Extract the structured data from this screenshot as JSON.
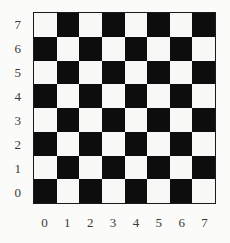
{
  "figure": {
    "background_color": "#fbfbf9"
  },
  "chart_data": {
    "type": "heatmap",
    "title": "",
    "subtitle": "",
    "xlabel": "",
    "ylabel": "",
    "grid": false,
    "legend": null,
    "rows": 8,
    "cols": 8,
    "x": [
      0,
      1,
      2,
      3,
      4,
      5,
      6,
      7
    ],
    "y": [
      7,
      6,
      5,
      4,
      3,
      2,
      1,
      0
    ],
    "xlim": [
      0,
      7
    ],
    "ylim": [
      0,
      7
    ],
    "x_tick_labels": [
      "0",
      "1",
      "2",
      "3",
      "4",
      "5",
      "6",
      "7"
    ],
    "y_tick_labels": [
      "7",
      "6",
      "5",
      "4",
      "3",
      "2",
      "1",
      "0"
    ],
    "colors": {
      "light_cell": "#f8f8f6",
      "dark_cell": "#0d0d0d",
      "border": "#1a1a1a",
      "tick_label": "#3a3a38"
    },
    "cell_states": [
      [
        "light",
        "dark",
        "light",
        "dark",
        "light",
        "dark",
        "light",
        "dark"
      ],
      [
        "dark",
        "light",
        "dark",
        "light",
        "dark",
        "light",
        "dark",
        "light"
      ],
      [
        "light",
        "dark",
        "light",
        "dark",
        "light",
        "dark",
        "light",
        "dark"
      ],
      [
        "dark",
        "light",
        "dark",
        "light",
        "dark",
        "light",
        "dark",
        "light"
      ],
      [
        "light",
        "dark",
        "light",
        "dark",
        "light",
        "dark",
        "light",
        "dark"
      ],
      [
        "dark",
        "light",
        "dark",
        "light",
        "dark",
        "light",
        "dark",
        "light"
      ],
      [
        "light",
        "dark",
        "light",
        "dark",
        "light",
        "dark",
        "light",
        "dark"
      ],
      [
        "dark",
        "light",
        "dark",
        "light",
        "dark",
        "light",
        "dark",
        "light"
      ]
    ],
    "values": [
      [
        1,
        0,
        1,
        0,
        1,
        0,
        1,
        0
      ],
      [
        0,
        1,
        0,
        1,
        0,
        1,
        0,
        1
      ],
      [
        1,
        0,
        1,
        0,
        1,
        0,
        1,
        0
      ],
      [
        0,
        1,
        0,
        1,
        0,
        1,
        0,
        1
      ],
      [
        1,
        0,
        1,
        0,
        1,
        0,
        1,
        0
      ],
      [
        0,
        1,
        0,
        1,
        0,
        1,
        0,
        1
      ],
      [
        1,
        0,
        1,
        0,
        1,
        0,
        1,
        0
      ],
      [
        0,
        1,
        0,
        1,
        0,
        1,
        0,
        1
      ]
    ]
  }
}
